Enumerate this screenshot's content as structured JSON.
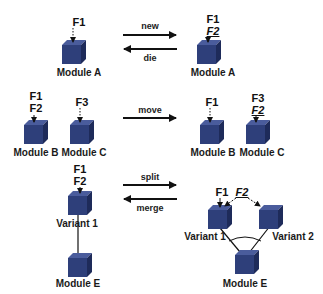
{
  "rows": {
    "new_die": {
      "left": {
        "module": "Module A",
        "features": [
          "F1"
        ]
      },
      "right": {
        "module": "Module A",
        "features": [
          "F1"
        ],
        "new_feature": "F2"
      },
      "ops": {
        "forward": "new",
        "backward": "die"
      }
    },
    "move": {
      "left": [
        {
          "module": "Module B",
          "features": [
            "F1",
            "F2"
          ]
        },
        {
          "module": "Module C",
          "features": [
            "F3"
          ]
        }
      ],
      "right": [
        {
          "module": "Module B",
          "features": [
            "F1"
          ]
        },
        {
          "module": "Module C",
          "features": [
            "F3"
          ],
          "moved_feature": "F2"
        }
      ],
      "ops": {
        "forward": "move"
      }
    },
    "split_merge": {
      "left": {
        "variant": {
          "module": "Variant 1",
          "features": [
            "F1",
            "F2"
          ]
        },
        "base": {
          "module": "Module E"
        }
      },
      "right": {
        "variant1": {
          "module": "Variant 1",
          "features": [
            "F1"
          ]
        },
        "split_feature": "F2",
        "variant2": {
          "module": "Variant 2"
        },
        "base": {
          "module": "Module E"
        }
      },
      "ops": {
        "forward": "split",
        "backward": "merge"
      }
    }
  },
  "colors": {
    "cube_front": "#2e3f7a",
    "cube_top": "#4a5c9c",
    "cube_side": "#1e2b5a",
    "arrow": "#111111"
  }
}
